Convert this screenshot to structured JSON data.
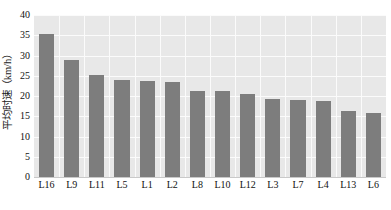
{
  "chart_data": {
    "type": "bar",
    "title": "",
    "subtitle": "",
    "xlabel": "",
    "ylabel": "平均时速（km/h）",
    "categories": [
      "L16",
      "L9",
      "L11",
      "L5",
      "L1",
      "L2",
      "L8",
      "L10",
      "L12",
      "L3",
      "L7",
      "L4",
      "L13",
      "L6"
    ],
    "values": [
      35.2,
      28.8,
      25.2,
      24.0,
      23.6,
      23.4,
      21.3,
      21.2,
      20.5,
      19.3,
      19.1,
      18.7,
      16.3,
      15.9
    ],
    "series": [
      {
        "name": "平均时速",
        "values": [
          35.2,
          28.8,
          25.2,
          24.0,
          23.6,
          23.4,
          21.3,
          21.2,
          20.5,
          19.3,
          19.1,
          18.7,
          16.3,
          15.9
        ]
      }
    ],
    "ylim": [
      0,
      40
    ],
    "ytick_values": [
      0,
      5,
      10,
      15,
      20,
      25,
      30,
      35,
      40
    ],
    "ytick_labels": [
      "0",
      "5",
      "10",
      "15",
      "20",
      "25",
      "30",
      "35",
      "40"
    ],
    "grid": true,
    "grid_axis": "both",
    "legend": false,
    "legend_position": "none",
    "bar_color": "#7d7d7d",
    "plot_background": "#e8e8e8",
    "gridline_color": "#fbfbfb",
    "page_background": "#ffffff",
    "annotations": []
  }
}
